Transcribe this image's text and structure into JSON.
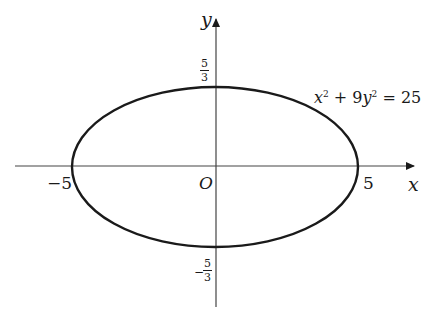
{
  "diagram": {
    "axes": {
      "x_label": "x",
      "y_label": "y",
      "origin_label": "O"
    },
    "ticks": {
      "x_neg": "−5",
      "x_pos": "5",
      "y_pos": {
        "num": "5",
        "den": "3"
      },
      "y_neg": {
        "sign": "−",
        "num": "5",
        "den": "3"
      }
    },
    "equation": {
      "x": "x",
      "exp1": "2",
      "plus": " + 9",
      "y": "y",
      "exp2": "2",
      "rhs": " = 25"
    },
    "colors": {
      "stroke": "#1a1a1a",
      "background": "#ffffff"
    }
  }
}
